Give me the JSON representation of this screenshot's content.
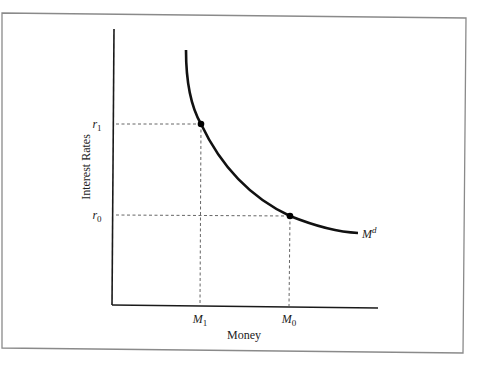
{
  "figure": {
    "type": "money-demand-diagram",
    "y_axis_label": "Interest Rates",
    "x_axis_label": "Money",
    "curve_label": {
      "base": "M",
      "superscript": "d"
    },
    "y_ticks": [
      {
        "base": "r",
        "subscript": "1"
      },
      {
        "base": "r",
        "subscript": "0"
      }
    ],
    "x_ticks": [
      {
        "base": "M",
        "subscript": "1"
      },
      {
        "base": "M",
        "subscript": "0"
      }
    ],
    "points": [
      {
        "name": "point-r1-M1",
        "x_label": "M1",
        "y_label": "r1"
      },
      {
        "name": "point-r0-M0",
        "x_label": "M0",
        "y_label": "r0"
      }
    ],
    "colors": {
      "frame": "#8a8a8a",
      "axis": "#1a1a1a",
      "curve": "#111111",
      "guide": "#555555",
      "text": "#222222"
    }
  }
}
